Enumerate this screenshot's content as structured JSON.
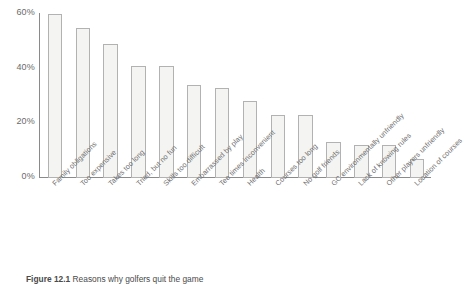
{
  "chart_data": {
    "type": "bar",
    "title": "",
    "subtitle": "",
    "xlabel": "",
    "ylabel": "",
    "ylim": [
      0,
      60
    ],
    "grid": false,
    "legend": false,
    "y_ticks": [
      "0%",
      "20%",
      "40%",
      "60%"
    ],
    "y_tick_values": [
      0,
      20,
      40,
      60
    ],
    "categories": [
      "Family obligations",
      "Too expensive",
      "Takes too long",
      "Tried, but no fun",
      "Skills too difficult",
      "Embarrassed by play",
      "Tee times inconvenient",
      "Health",
      "Courses too long",
      "No golf friends",
      "GC environmentally unfriendly",
      "Lack of knowing rules",
      "Other players unfriendly",
      "Location of courses"
    ],
    "values": [
      60,
      55,
      49,
      41,
      41,
      34,
      33,
      28,
      23,
      23,
      13,
      12,
      12,
      7
    ],
    "bar_fill": "#f4f4f2",
    "bar_border": "#b2b2b2",
    "axis_color": "#8a8a8a",
    "text_color": "#6e6e6e"
  },
  "caption": {
    "label": "Figure 12.1",
    "text": "Reasons why golfers quit the game"
  }
}
